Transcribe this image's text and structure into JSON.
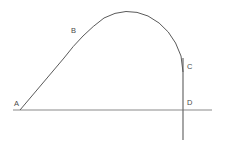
{
  "diagram": {
    "canvas": {
      "width": 227,
      "height": 145,
      "background": "#ffffff"
    },
    "colors": {
      "curve_stroke": "#5a5a5a",
      "axis_stroke": "#8a8a8a",
      "vertical_stroke": "#6a6a6a",
      "label_text": "#4a4a4a"
    },
    "stroke_widths": {
      "curve": 1,
      "horizontal_axis": 1.2,
      "vertical_line": 1.2
    },
    "labels": [
      {
        "id": "A",
        "text": "A",
        "x": 14,
        "y": 104,
        "anchor": "start"
      },
      {
        "id": "B",
        "text": "B",
        "x": 71,
        "y": 31,
        "anchor": "start"
      },
      {
        "id": "C",
        "text": "C",
        "x": 187,
        "y": 67,
        "anchor": "start"
      },
      {
        "id": "D",
        "text": "D",
        "x": 187,
        "y": 103,
        "anchor": "start"
      }
    ],
    "points": [
      {
        "id": "A",
        "x": 20,
        "y": 110,
        "description": "start of curve on horizontal line"
      },
      {
        "id": "B",
        "x": 78,
        "y": 42,
        "description": "point on rising portion of curve"
      },
      {
        "id": "C",
        "x": 183,
        "y": 67,
        "description": "point on vertical descending line"
      },
      {
        "id": "D",
        "x": 183,
        "y": 110,
        "description": "intersection of vertical line and horizontal line"
      }
    ],
    "shapes": {
      "horizontal_axis": {
        "x1": 13,
        "y1": 110,
        "x2": 212,
        "y2": 110
      },
      "vertical_line": {
        "x1": 183,
        "y1": 58,
        "x2": 183,
        "y2": 140
      },
      "curve_path": "M 20 110 L 64 58 Q 82 34 104 18 Q 126 6 148 16 Q 172 28 181 56 L 183 72",
      "curve_apex": {
        "x": 130,
        "y": 10
      }
    }
  }
}
